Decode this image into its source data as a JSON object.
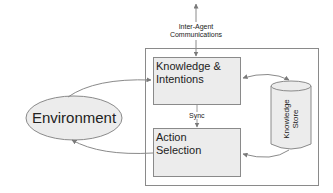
{
  "diagram": {
    "type": "agent-architecture",
    "nodes": {
      "environment": {
        "label": "Environment",
        "shape": "ellipse"
      },
      "knowledge_intentions": {
        "line1": "Knowledge &",
        "line2": "Intentions",
        "shape": "rectangle"
      },
      "action_selection": {
        "line1": "Action",
        "line2": "Selection",
        "shape": "rectangle"
      },
      "knowledge_store": {
        "line1": "Knowledge",
        "line2": "Store",
        "shape": "cylinder"
      }
    },
    "labels": {
      "inter_agent_line1": "Inter-Agent",
      "inter_agent_line2": "Communications",
      "sync": "Sync"
    },
    "edges": [
      {
        "from": "environment",
        "to": "knowledge_intentions"
      },
      {
        "from": "action_selection",
        "to": "environment"
      },
      {
        "from": "knowledge_intentions",
        "to": "action_selection",
        "label": "Sync"
      },
      {
        "from": "knowledge_intentions",
        "to": "knowledge_store",
        "bidirectional": true
      },
      {
        "from": "knowledge_store",
        "to": "action_selection"
      },
      {
        "from": "external",
        "to": "knowledge_intentions",
        "label": "Inter-Agent Communications",
        "bidirectional": true
      }
    ],
    "colors": {
      "box_fill": "#ececec",
      "stroke": "#8a8a8a",
      "text": "#222222",
      "background": "#ffffff"
    }
  }
}
